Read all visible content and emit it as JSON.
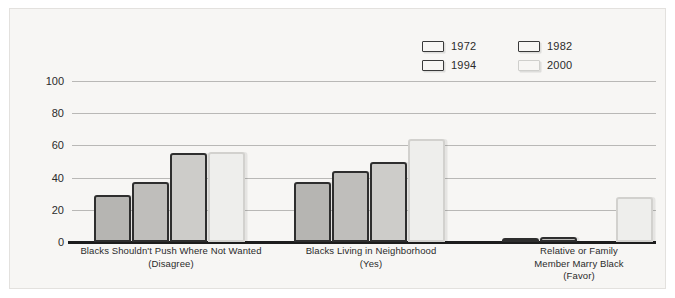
{
  "chart_data": {
    "type": "bar",
    "title": "",
    "xlabel": "",
    "ylabel": "",
    "ylim": [
      0,
      100
    ],
    "yticks": [
      0,
      20,
      40,
      60,
      80,
      100
    ],
    "grid": true,
    "legend_position": "top-right",
    "categories": [
      "Blacks Shouldn't Push Where Not Wanted\n(Disagree)",
      "Blacks Living in Neighborhood\n(Yes)",
      "Relative or Family\nMember Marry Black\n(Favor)"
    ],
    "category_lines": [
      [
        "Blacks Shouldn't Push Where Not Wanted",
        "(Disagree)"
      ],
      [
        "Blacks Living in Neighborhood",
        "(Yes)"
      ],
      [
        "Relative or Family",
        "Member Marry Black",
        "(Favor)"
      ]
    ],
    "series": [
      {
        "name": "1972",
        "color": "#b6b5b2",
        "values": [
          29,
          37,
          2
        ]
      },
      {
        "name": "1982",
        "color": "#bfbebb",
        "values": [
          37,
          44,
          3
        ]
      },
      {
        "name": "1994",
        "color": "#cdccc9",
        "values": [
          55,
          50,
          0
        ]
      },
      {
        "name": "2000",
        "color": "#eeeeec",
        "values": [
          56,
          64,
          28
        ]
      }
    ]
  },
  "legend": {
    "items": [
      {
        "label": "1972",
        "swatch_class": "c1972"
      },
      {
        "label": "1982",
        "swatch_class": "c1982"
      },
      {
        "label": "1994",
        "swatch_class": "c1994"
      },
      {
        "label": "2000",
        "swatch_class": "c2000"
      }
    ]
  },
  "axis": {
    "y_tick_labels": [
      "0",
      "20",
      "40",
      "60",
      "80",
      "100"
    ]
  }
}
